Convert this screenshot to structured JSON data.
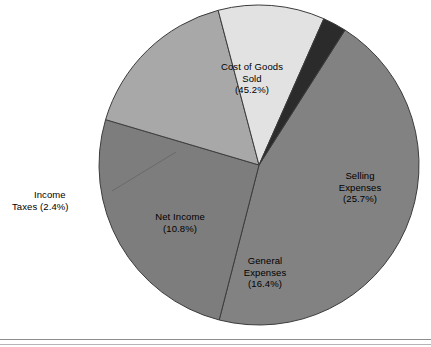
{
  "chart_data": {
    "type": "pie",
    "title": "",
    "subtitle": "",
    "xlabel": "",
    "ylabel": "",
    "legend_position": "none",
    "grid": false,
    "units": "percent",
    "categories": [
      "Cost of Goods Sold",
      "Selling Expenses",
      "General Expenses",
      "Net Income",
      "Income Taxes"
    ],
    "values": [
      45.2,
      25.7,
      16.4,
      10.8,
      2.4
    ],
    "slices": [
      {
        "name": "Cost of Goods Sold",
        "label_line1": "Cost of Goods",
        "label_line2": "Sold",
        "label_line3": "(45.2%)",
        "value": 45.2,
        "value_text": "(45.2%)",
        "color": "#828282",
        "label_placement": "inside"
      },
      {
        "name": "Selling Expenses",
        "label_line1": "Selling",
        "label_line2": "Expenses",
        "label_line3": "(25.7%)",
        "value": 25.7,
        "value_text": "(25.7%)",
        "color": "#7d7d7d",
        "label_placement": "inside"
      },
      {
        "name": "General Expenses",
        "label_line1": "General",
        "label_line2": "Expenses",
        "label_line3": "(16.4%)",
        "value": 16.4,
        "value_text": "(16.4%)",
        "color": "#a8a8a8",
        "label_placement": "inside"
      },
      {
        "name": "Net Income",
        "label_line1": "Net Income",
        "label_line2": "(10.8%)",
        "label_line3": "",
        "value": 10.8,
        "value_text": "(10.8%)",
        "color": "#e2e2e2",
        "label_placement": "inside"
      },
      {
        "name": "Income Taxes",
        "label_line1": "Income",
        "label_line2": "Taxes (2.4%)",
        "label_line3": "",
        "value": 2.4,
        "value_text": "(2.4%)",
        "color": "#2b2b2b",
        "label_placement": "outside-left-with-leader"
      }
    ],
    "geometry": {
      "center_x": 259,
      "center_y": 165,
      "radius": 160,
      "start_angle_deg": -57.5,
      "direction": "clockwise"
    },
    "style": {
      "background": "#ffffff",
      "slice_outline": "#3c3c3c",
      "leader_line_color": "#6a6a6a",
      "baseline_rule_color": "#8d8d8d"
    }
  }
}
